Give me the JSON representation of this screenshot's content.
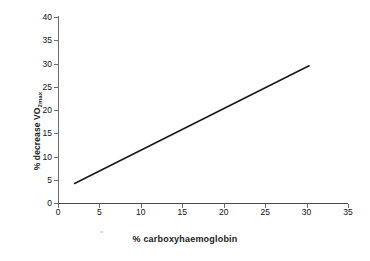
{
  "chart_data": {
    "type": "line",
    "title": "",
    "xlabel": "% carboxyhaemoglobin",
    "ylabel": "% decrease VO2max",
    "ylabel_base": "% decrease VO",
    "ylabel_sub": "2max",
    "xlim": [
      0,
      35
    ],
    "ylim": [
      0,
      40
    ],
    "xticks": [
      0,
      5,
      10,
      15,
      20,
      25,
      30,
      35
    ],
    "yticks": [
      0,
      5,
      10,
      15,
      20,
      25,
      30,
      35,
      40
    ],
    "grid": false,
    "legend": false,
    "series": [
      {
        "name": "% decrease VO2max vs % carboxyhaemoglobin",
        "color": "#1a1a1a",
        "line_width": 1.6,
        "x": [
          2.0,
          30.3
        ],
        "y": [
          4.2,
          29.5
        ],
        "points": [
          [
            2.0,
            4.2
          ],
          [
            30.3,
            29.5
          ]
        ],
        "slope": 0.894,
        "intercept": 2.41
      }
    ]
  },
  "axes": {
    "x": {
      "ticks": [
        {
          "value": 0,
          "label": "0"
        },
        {
          "value": 5,
          "label": "5"
        },
        {
          "value": 10,
          "label": "10"
        },
        {
          "value": 15,
          "label": "15"
        },
        {
          "value": 20,
          "label": "20"
        },
        {
          "value": 25,
          "label": "25"
        },
        {
          "value": 30,
          "label": "30"
        },
        {
          "value": 35,
          "label": "35"
        }
      ]
    },
    "y": {
      "ticks": [
        {
          "value": 0,
          "label": "0"
        },
        {
          "value": 5,
          "label": "5"
        },
        {
          "value": 10,
          "label": "10"
        },
        {
          "value": 15,
          "label": "15"
        },
        {
          "value": 20,
          "label": "20"
        },
        {
          "value": 25,
          "label": "25"
        },
        {
          "value": 30,
          "label": "30"
        },
        {
          "value": 35,
          "label": "35"
        },
        {
          "value": 40,
          "label": "40"
        }
      ]
    }
  },
  "colors": {
    "series_line": "#1a1a1a",
    "axis": "#6e6e6e",
    "text": "#111111",
    "background": "#ffffff"
  }
}
